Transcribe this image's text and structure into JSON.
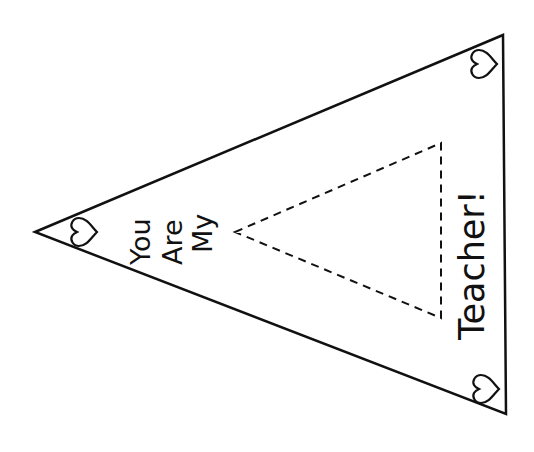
{
  "pennant": {
    "title_lines": [
      "You",
      "Are",
      "My"
    ],
    "bottom_text": "Teacher!",
    "decorations": [
      "heart-left",
      "heart-top-right",
      "heart-bottom-right"
    ],
    "cutout": "dashed-triangle",
    "colors": {
      "line": "#111111",
      "background": "#ffffff"
    }
  }
}
